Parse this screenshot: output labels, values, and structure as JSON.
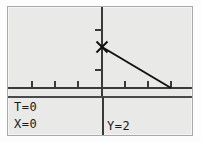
{
  "device": {
    "kind": "graphing-calculator-screen",
    "background_color": "#e9e9e7",
    "ink_color": "#1a1a1a",
    "frame_color": "#a9a9a9"
  },
  "status": {
    "t_readout": "T=0",
    "x_readout": "X=0",
    "y_readout": "Y=2"
  },
  "chart_data": {
    "type": "line",
    "title": "",
    "xlabel": "",
    "ylabel": "",
    "grid": false,
    "legend": null,
    "axes": {
      "x_axis_y_pixel": 81,
      "y_axis_x_pixel": 94,
      "x_tick_pixels": [
        24,
        47,
        70,
        117,
        140,
        163
      ],
      "y_tick_pixels": [
        23,
        63
      ],
      "tick_mark_length": 7,
      "axis_color": "#3a3a3a"
    },
    "series": [
      {
        "name": "line-segment",
        "start_point": {
          "x": 0,
          "y": 2
        },
        "end_point": {
          "x": 3,
          "y": 0
        },
        "start_pixel": {
          "x": 94,
          "y": 40
        },
        "end_pixel": {
          "x": 163,
          "y": 81
        },
        "color": "#111111",
        "width": 2
      }
    ],
    "cursor": {
      "label": "trace-cursor",
      "glyph": "x-cross",
      "x": 0,
      "y": 2,
      "pixel": {
        "x": 94,
        "y": 40
      },
      "size": 11,
      "color": "#111111"
    }
  }
}
